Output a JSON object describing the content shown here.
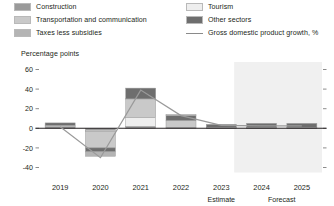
{
  "legend": {
    "items": [
      {
        "label": "Construction",
        "color": "#9a9a9a",
        "type": "swatch",
        "name": "legend-construction"
      },
      {
        "label": "Tourism",
        "color": "#eeeeee",
        "type": "swatch",
        "name": "legend-tourism"
      },
      {
        "label": "Transportation and communication",
        "color": "#c9c9c9",
        "type": "swatch",
        "name": "legend-transportation"
      },
      {
        "label": "Other sectors",
        "color": "#6e6e6e",
        "type": "swatch",
        "name": "legend-other-sectors"
      },
      {
        "label": "Taxes less subsidies",
        "color": "#b4b4b4",
        "type": "swatch",
        "name": "legend-taxes"
      },
      {
        "label": "Gross domestic product growth, %",
        "color": "#8a8a8a",
        "type": "line",
        "name": "legend-gdp-growth"
      }
    ]
  },
  "axis": {
    "y_title": "Percentage points",
    "y_ticks": [
      "60",
      "40",
      "20",
      "0",
      "-20",
      "-40"
    ]
  },
  "footnotes": {
    "estimate": "Estimate",
    "forecast": "Forecast"
  },
  "chart_data": {
    "type": "bar",
    "title": "",
    "subtitle": "",
    "xlabel": "",
    "ylabel": "Percentage points",
    "ylim": [
      -40,
      60
    ],
    "yticks": [
      60,
      40,
      20,
      0,
      -20,
      -40
    ],
    "grid": false,
    "legend_position": "top",
    "stacked": true,
    "categories": [
      "2019",
      "2020",
      "2021",
      "2022",
      "2023",
      "2024",
      "2025"
    ],
    "annotations": [
      {
        "text": "Estimate",
        "under_category": "2023"
      },
      {
        "text": "Forecast",
        "under_category": "2024-2025",
        "span": [
          "2024",
          "2025"
        ]
      }
    ],
    "forecast_shading": {
      "from": "2023.5",
      "to": "2025.5",
      "color": "#f0f0f0"
    },
    "series": [
      {
        "name": "Construction",
        "color": "#9a9a9a",
        "values": [
          1.5,
          -2.0,
          2.0,
          1.0,
          0.5,
          0.5,
          0.5
        ]
      },
      {
        "name": "Tourism",
        "color": "#eeeeee",
        "values": [
          0.0,
          -1.0,
          9.0,
          0.0,
          0.0,
          0.0,
          0.0
        ]
      },
      {
        "name": "Transportation and communication",
        "color": "#c9c9c9",
        "values": [
          1.5,
          -17.0,
          19.0,
          7.0,
          0.5,
          0.5,
          0.5
        ]
      },
      {
        "name": "Other sectors",
        "color": "#6e6e6e",
        "values": [
          2.5,
          -4.0,
          11.0,
          5.0,
          3.0,
          4.0,
          4.0
        ]
      },
      {
        "name": "Taxes less subsidies",
        "color": "#b4b4b4",
        "values": [
          0.0,
          -4.5,
          0.0,
          1.0,
          0.0,
          0.0,
          0.0
        ]
      }
    ],
    "line_series": {
      "name": "Gross domestic product growth, %",
      "color": "#9a9a9a",
      "values": [
        1.5,
        -30.0,
        39.0,
        13.0,
        3.0,
        2.5,
        2.5
      ]
    }
  }
}
